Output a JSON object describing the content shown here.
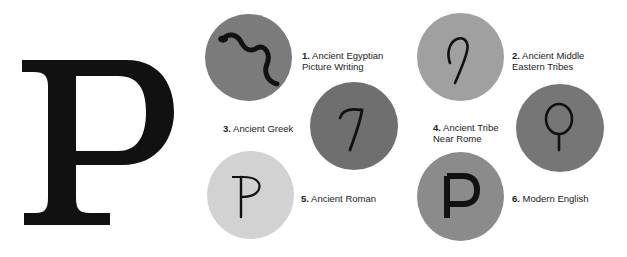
{
  "title_letter": "P",
  "stages": [
    {
      "number": "1.",
      "line1": "Ancient Egyptian",
      "line2": "Picture Writing",
      "symbol": "snake-icon",
      "color": "#7b7b7b"
    },
    {
      "number": "2.",
      "line1": "Ancient Middle",
      "line2": "Eastern Tribes",
      "symbol": "hook-icon",
      "color": "#a0a0a0"
    },
    {
      "number": "3.",
      "line1": "Ancient Greek",
      "line2": "",
      "symbol": "greek-pi-7-icon",
      "color": "#6f6f6f"
    },
    {
      "number": "4.",
      "line1": "Ancient Tribe",
      "line2": "Near Rome",
      "symbol": "loop-stem-icon",
      "color": "#767676"
    },
    {
      "number": "5.",
      "line1": "Ancient Roman",
      "line2": "",
      "symbol": "roman-p-icon",
      "color": "#d2d2d2"
    },
    {
      "number": "6.",
      "line1": "Modern English",
      "line2": "",
      "symbol": "modern-p-icon",
      "color": "#8b8b8b"
    }
  ]
}
